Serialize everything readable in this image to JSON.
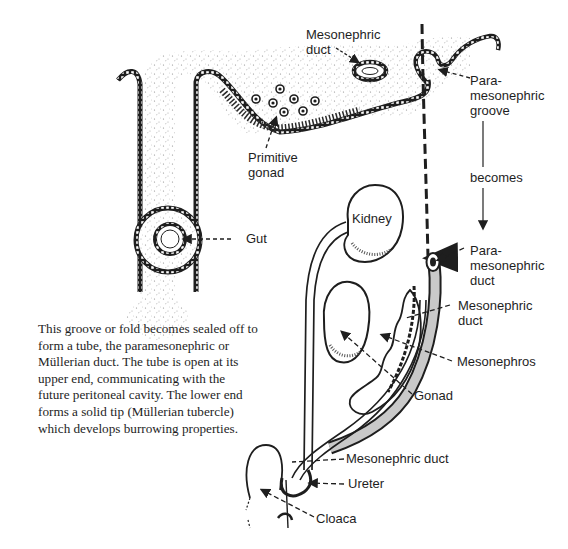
{
  "figure": {
    "description_paragraph": "This groove or fold becomes sealed off to form a tube, the paramesonephric or Müllerian duct. The tube is open at its upper end, communicating with the future peritoneal cavity. The lower end forms a solid tip (Müllerian tubercle) which develops burrowing properties.",
    "top_section": {
      "labels": {
        "mesonephric_duct": "Mesonephric\nduct",
        "paramesonephric_groove": "Para-\nmesonephric\ngroove",
        "primitive_gonad": "Primitive\ngonad",
        "gut": "Gut"
      }
    },
    "transition": {
      "becomes": "becomes"
    },
    "bottom_section": {
      "labels": {
        "kidney": "Kidney",
        "paramesonephric_duct": "Para-\nmesonephric\nduct",
        "mesonephric_duct_upper": "Mesonephric\nduct",
        "mesonephros": "Mesonephros",
        "gonad": "Gonad",
        "mesonephric_duct_lower": "Mesonephric duct",
        "ureter": "Ureter",
        "cloaca": "Cloaca"
      }
    },
    "colors": {
      "ink": "#1e1e1e",
      "stipple": "#8a8a8a",
      "background": "#ffffff"
    }
  }
}
